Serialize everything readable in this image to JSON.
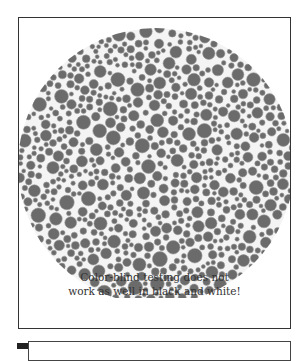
{
  "figure": {
    "caption_lines": [
      "Color-blind testing does not",
      "work as well in black and white!"
    ]
  },
  "plate": {
    "cx": 137,
    "cy": 148,
    "r": 138,
    "dot_color": "#6b6b6b",
    "dot_stroke": "#9a9a9a",
    "background": "#f4f4f4",
    "seed": 7,
    "min_dot_r": 2.0,
    "max_dot_r": 7.5
  },
  "colors": {
    "frame": "#333333",
    "text": "#333333"
  }
}
